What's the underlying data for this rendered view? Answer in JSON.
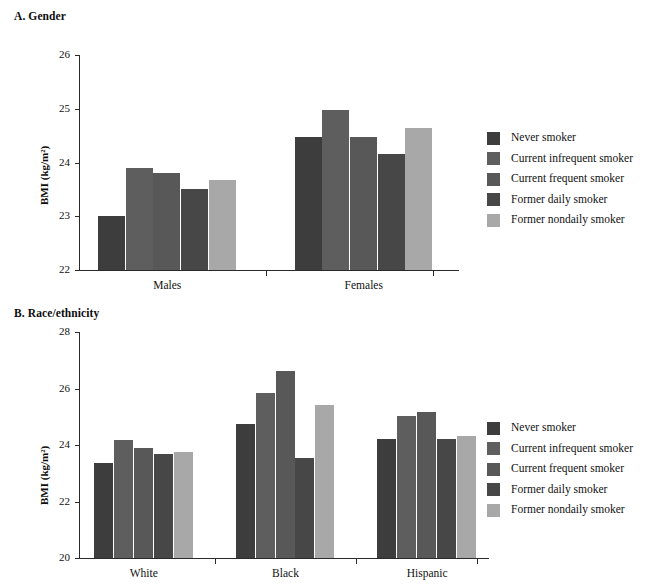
{
  "figure": {
    "panels": [
      {
        "id": "gender",
        "title": "A. Gender",
        "ylabel": "BMI (kg/m²)",
        "yticks": [
          "22",
          "23",
          "24",
          "25",
          "26"
        ],
        "categories": [
          "Males",
          "Females"
        ]
      },
      {
        "id": "race",
        "title": "B. Race/ethnicity",
        "ylabel": "BMI (kg/m²)",
        "yticks": [
          "20",
          "22",
          "24",
          "26",
          "28"
        ],
        "categories": [
          "White",
          "Black",
          "Hispanic"
        ]
      }
    ],
    "legend": {
      "items": [
        {
          "label": "Never smoker",
          "color": "#3d3d3d"
        },
        {
          "label": "Current infrequent smoker",
          "color": "#5e5e5e"
        },
        {
          "label": "Current frequent smoker",
          "color": "#585858"
        },
        {
          "label": "Former daily smoker",
          "color": "#474747"
        },
        {
          "label": "Former nondaily smoker",
          "color": "#a8a8a8"
        }
      ]
    }
  },
  "chart_data": [
    {
      "type": "bar",
      "title": "A. Gender",
      "xlabel": "",
      "ylabel": "BMI (kg/m²)",
      "ylim": [
        22,
        26
      ],
      "ytick_step": 1,
      "grid": false,
      "legend_position": "right",
      "categories": [
        "Males",
        "Females"
      ],
      "series": [
        {
          "name": "Never smoker",
          "values": [
            23.0,
            24.47
          ],
          "color": "#3d3d3d"
        },
        {
          "name": "Current infrequent smoker",
          "values": [
            23.9,
            24.97
          ],
          "color": "#5e5e5e"
        },
        {
          "name": "Current frequent smoker",
          "values": [
            23.8,
            24.47
          ],
          "color": "#585858"
        },
        {
          "name": "Former daily smoker",
          "values": [
            23.5,
            24.15
          ],
          "color": "#474747"
        },
        {
          "name": "Former nondaily smoker",
          "values": [
            23.68,
            24.65
          ],
          "color": "#a8a8a8"
        }
      ]
    },
    {
      "type": "bar",
      "title": "B. Race/ethnicity",
      "xlabel": "",
      "ylabel": "BMI (kg/m²)",
      "ylim": [
        20,
        28
      ],
      "ytick_step": 2,
      "grid": false,
      "legend_position": "right",
      "categories": [
        "White",
        "Black",
        "Hispanic"
      ],
      "series": [
        {
          "name": "Never smoker",
          "values": [
            23.38,
            24.75,
            24.22
          ],
          "color": "#3d3d3d"
        },
        {
          "name": "Current infrequent smoker",
          "values": [
            24.17,
            25.85,
            25.03
          ],
          "color": "#5e5e5e"
        },
        {
          "name": "Current frequent smoker",
          "values": [
            23.88,
            26.62,
            25.18
          ],
          "color": "#585858"
        },
        {
          "name": "Former daily smoker",
          "values": [
            23.67,
            23.53,
            24.22
          ],
          "color": "#474747"
        },
        {
          "name": "Former nondaily smoker",
          "values": [
            23.77,
            25.43,
            24.32
          ],
          "color": "#a8a8a8"
        }
      ]
    }
  ]
}
